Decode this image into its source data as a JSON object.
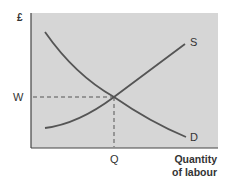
{
  "diagram": {
    "y_axis_label": "£",
    "x_axis_label_line1": "Quantity",
    "x_axis_label_line2": "of labour",
    "equilibrium_wage_label": "W",
    "equilibrium_quantity_label": "Q",
    "supply_label": "S",
    "demand_label": "D"
  },
  "colors": {
    "plot_background": "#d6d6d6",
    "curve": "#555555",
    "axis": "#444444"
  }
}
